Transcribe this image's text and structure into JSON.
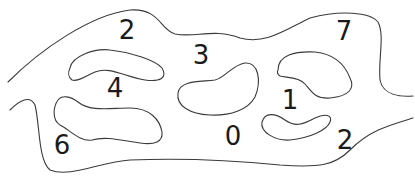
{
  "diagram": {
    "type": "region-numbering-puzzle",
    "stroke_color": "#3a3a3a",
    "text_color": "#1a1a1a",
    "background": "#ffffff",
    "numbers": [
      {
        "label": "2",
        "x": 127,
        "y": 30
      },
      {
        "label": "3",
        "x": 201,
        "y": 55
      },
      {
        "label": "7",
        "x": 344,
        "y": 31
      },
      {
        "label": "4",
        "x": 115,
        "y": 88
      },
      {
        "label": "1",
        "x": 290,
        "y": 100
      },
      {
        "label": "6",
        "x": 62,
        "y": 145
      },
      {
        "label": "0",
        "x": 233,
        "y": 136
      },
      {
        "label": "2",
        "x": 345,
        "y": 140
      }
    ],
    "shapes": [
      {
        "name": "outer-upper-boundary",
        "d": "M 8 82 C 40 50, 90 15, 130 10 C 160 8, 160 30, 175 34 C 195 38, 215 28, 240 38 C 265 45, 285 30, 310 18 C 340 10, 370 12, 378 22 C 385 35, 378 60, 380 80 C 383 95, 400 97, 413 96"
      },
      {
        "name": "outer-lower-boundary",
        "d": "M 10 110 C 20 100, 30 95, 35 105 C 40 125, 38 160, 50 170 C 70 178, 100 162, 130 160 C 180 158, 230 160, 280 165 C 320 168, 335 165, 350 150 C 370 130, 390 125, 413 118"
      },
      {
        "name": "blob-upper-left",
        "d": "M 70 68 C 72 56, 95 48, 110 50 C 130 52, 155 60, 162 68 C 168 78, 160 82, 145 80 C 125 77, 110 66, 95 72 C 85 76, 78 82, 72 80 C 68 77, 68 72, 70 68 Z"
      },
      {
        "name": "blob-lower-left",
        "d": "M 58 100 C 62 95, 70 96, 78 102 C 90 112, 110 108, 130 108 C 150 108, 160 120, 162 132 C 163 142, 155 145, 140 143 C 120 140, 105 136, 92 140 C 80 142, 70 130, 60 125 C 52 120, 53 107, 58 100 Z"
      },
      {
        "name": "blob-center",
        "d": "M 178 93 C 180 80, 200 82, 215 80 C 225 78, 232 65, 245 63 C 258 62, 262 80, 255 97 C 248 110, 230 116, 210 115 C 190 114, 176 106, 178 93 Z"
      },
      {
        "name": "blob-upper-right",
        "d": "M 278 70 C 278 55, 295 51, 315 52 C 335 54, 345 65, 350 78 C 355 88, 350 96, 330 98 C 315 99, 312 92, 305 84 C 298 76, 285 78, 280 76 C 277 74, 277 72, 278 70 Z"
      },
      {
        "name": "blob-lower-right",
        "d": "M 262 122 C 265 112, 275 113, 285 120 C 295 127, 302 125, 315 118 C 325 113, 333 115, 330 122 C 327 130, 310 138, 290 140 C 275 141, 260 132, 262 122 Z"
      }
    ]
  }
}
